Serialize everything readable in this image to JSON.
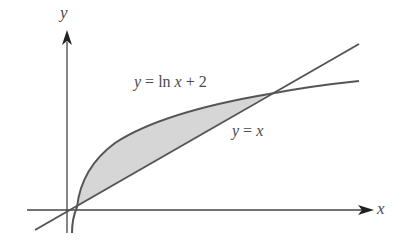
{
  "diagram": {
    "axes": {
      "x_label": "x",
      "y_label": "y"
    },
    "curves": [
      {
        "name": "log-curve",
        "label_y": "y",
        "label_eq": "=",
        "label_fn": "ln",
        "label_x": "x",
        "label_rest": "+ 2",
        "equation": "y = ln x + 2"
      },
      {
        "name": "line",
        "label_y": "y",
        "label_eq": "=",
        "label_x": "x",
        "equation": "y = x"
      }
    ],
    "shaded_region": "area between y = ln x + 2 and y = x",
    "colors": {
      "stroke": "#555555",
      "fill": "#d6d6d6",
      "text": "#4a4a4a"
    }
  }
}
